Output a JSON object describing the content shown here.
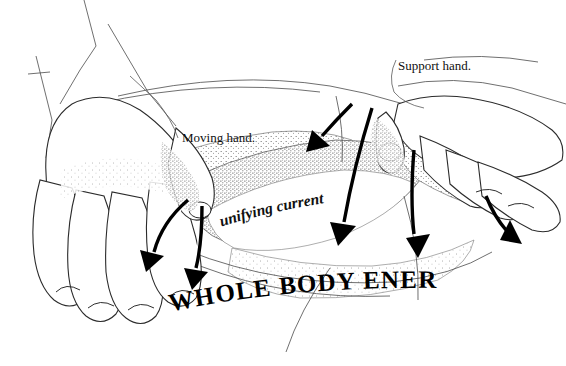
{
  "figure": {
    "title": "Whole Body Energy",
    "background_color": "#ffffff",
    "ink_color": "#1a1a1a",
    "width": 566,
    "height": 366
  },
  "caption": {
    "text": "WHOLE  BODY  ENERGY",
    "style": "bold-serif-arc"
  },
  "labels": {
    "moving_hand": "Moving hand.",
    "support_hand": "Support hand.",
    "unifying_current": "unifying current"
  },
  "annotations": {
    "arrow_count": "6",
    "arrow_color": "#000000",
    "leader_line_color": "#5a5a5a"
  },
  "rule": {
    "color": "#1a1a1a"
  }
}
